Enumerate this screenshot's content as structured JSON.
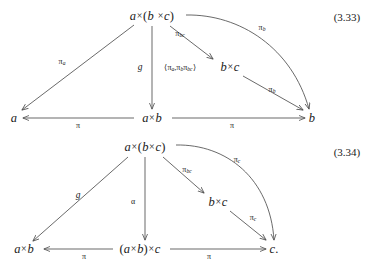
{
  "document": {
    "background": "#ffffff",
    "ink": "#1a1a1a",
    "arrow_color": "#4f4f4f"
  },
  "diagrams": [
    {
      "id": "diagram-3-33",
      "equation_number": "(3.33)",
      "nodes": [
        {
          "name": "node-a-times-b-times-c",
          "text": "a×(b ×c)",
          "x": 152,
          "y": 16
        },
        {
          "name": "node-b-times-c",
          "text": "b×c",
          "x": 230,
          "y": 67
        },
        {
          "name": "node-a",
          "text": "a",
          "x": 14,
          "y": 118
        },
        {
          "name": "node-a-times-b",
          "text": "a×b",
          "x": 152,
          "y": 118
        },
        {
          "name": "node-b",
          "text": "b",
          "x": 312,
          "y": 118
        }
      ],
      "edges": [
        {
          "name": "edge-pi-a",
          "label": "πa",
          "sub": "a",
          "base": "π",
          "x": 62,
          "y": 62
        },
        {
          "name": "edge-g",
          "label": "g",
          "x": 140,
          "y": 68,
          "style": "fn"
        },
        {
          "name": "edge-tuple",
          "label": "⟨πa,πbπbc⟩",
          "x": 180,
          "y": 68,
          "style": "tuple"
        },
        {
          "name": "edge-pi-bc",
          "label": "πbc",
          "sub": "bc",
          "base": "π",
          "x": 180,
          "y": 34
        },
        {
          "name": "edge-pi-b-curve",
          "label": "πb",
          "sub": "b",
          "base": "π",
          "x": 262,
          "y": 28
        },
        {
          "name": "edge-pi-b-diag",
          "label": "πb",
          "sub": "b",
          "base": "π",
          "x": 272,
          "y": 90
        },
        {
          "name": "edge-pi-left",
          "label": "π",
          "base": "π",
          "x": 78,
          "y": 126
        },
        {
          "name": "edge-pi-right",
          "label": "π",
          "base": "π",
          "x": 232,
          "y": 126
        }
      ]
    },
    {
      "id": "diagram-3-34",
      "equation_number": "(3.34)",
      "nodes": [
        {
          "name": "node-a-times-b-times-c",
          "text": "a×(b×c)",
          "x": 145,
          "y": 17
        },
        {
          "name": "node-b-times-c",
          "text": "b×c",
          "x": 218,
          "y": 72
        },
        {
          "name": "node-a-times-b",
          "text": "a×b",
          "x": 24,
          "y": 119
        },
        {
          "name": "node-a-times-b-paren-times-c",
          "text": "(a×b)×c",
          "x": 140,
          "y": 119
        },
        {
          "name": "node-c",
          "text": "c.",
          "x": 274,
          "y": 119
        }
      ],
      "edges": [
        {
          "name": "edge-g",
          "label": "g",
          "x": 78,
          "y": 66,
          "style": "fn"
        },
        {
          "name": "edge-alpha",
          "label": "α",
          "x": 133,
          "y": 72
        },
        {
          "name": "edge-pi-bc",
          "label": "πbc",
          "sub": "bc",
          "base": "π",
          "x": 187,
          "y": 40
        },
        {
          "name": "edge-pi-c-curve",
          "label": "πc",
          "sub": "c",
          "base": "π",
          "x": 237,
          "y": 30
        },
        {
          "name": "edge-pi-c-diag",
          "label": "πc",
          "sub": "c",
          "base": "π",
          "x": 253,
          "y": 88
        },
        {
          "name": "edge-pi-left",
          "label": "π",
          "base": "π",
          "x": 84,
          "y": 127
        },
        {
          "name": "edge-pi-right",
          "label": "π",
          "base": "π",
          "x": 209,
          "y": 127
        }
      ]
    }
  ]
}
